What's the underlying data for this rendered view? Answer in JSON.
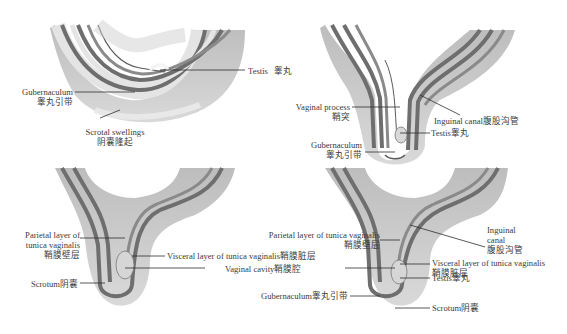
{
  "figure": {
    "type": "anatomical-diagram",
    "panels": [
      {
        "id": "a",
        "labels": {
          "testis": {
            "en": "Testis",
            "zh": "睾丸"
          },
          "gubernaculum": {
            "en": "Gubernaculum",
            "zh": "睾丸引带"
          },
          "scrotal_swellings": {
            "en": "Scrotal swellings",
            "zh": "阴囊隆起"
          }
        }
      },
      {
        "id": "b",
        "labels": {
          "vaginal_process": {
            "en": "Vaginal process",
            "zh": "鞘突"
          },
          "inguinal_canal": {
            "en": "Inguinal canal",
            "zh": "腹股沟管"
          },
          "testis": {
            "en": "Testis",
            "zh": "睾丸"
          },
          "gubernaculum": {
            "en": "Gubernaculum",
            "zh": "睾丸引带"
          }
        }
      },
      {
        "id": "c",
        "labels": {
          "parietal_layer_1": "Parietal layer of",
          "parietal_layer_2": "tunica vaginalis",
          "parietal_layer_zh": "鞘膜壁层",
          "visceral_layer": "Visceral layer of tunica vaginalis鞘膜脏层",
          "vaginal_cavity": "Vaginal cavity鞘膜腔",
          "scrotum": "Scrotum阴囊"
        }
      },
      {
        "id": "d",
        "labels": {
          "parietal_layer": "Parietal layer of tunica vaginalis",
          "parietal_layer_zh": "鞘膜壁层",
          "inguinal_1": "Inguinal",
          "inguinal_2": "canal",
          "inguinal_zh": "腹股沟管",
          "visceral_layer": "Visceral layer of tunica vaginalis",
          "visceral_layer_zh": "鞘膜脏层",
          "testis": "Testis睾丸",
          "gubernaculum": "Gubernaculum睾丸引带",
          "scrotum": "Scrotum阴囊"
        }
      }
    ],
    "colors": {
      "outer_tissue": "#c9c9c9",
      "light_layer": "#e2e2e2",
      "dark_band": "#6e6e6e",
      "mid_band": "#9a9a9a",
      "leader_line": "#2e2e2e",
      "background": "#ffffff"
    }
  }
}
